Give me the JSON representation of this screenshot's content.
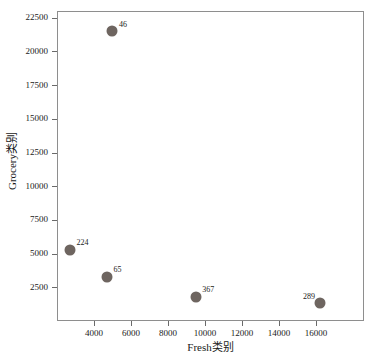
{
  "chart_data": {
    "type": "scatter",
    "title": "",
    "xlabel": "Fresh类别",
    "ylabel": "Grocery类别",
    "xlim": [
      2000,
      18600
    ],
    "ylim": [
      0,
      23000
    ],
    "xticks": [
      4000,
      6000,
      8000,
      10000,
      12000,
      14000,
      16000
    ],
    "xtick_labels": [
      "4000",
      "6000",
      "8000",
      "10000",
      "12000",
      "14000",
      "16000"
    ],
    "yticks": [
      2500,
      5000,
      7500,
      10000,
      12500,
      15000,
      17500,
      20000,
      22500
    ],
    "ytick_labels": [
      "2500",
      "5000",
      "7500",
      "10000",
      "12500",
      "15000",
      "17500",
      "20000",
      "22500"
    ],
    "grid": false,
    "legend": "none",
    "marker_color": "#6e6560",
    "marker_size_px": 11,
    "points": [
      {
        "label": "46",
        "x": 5000,
        "y": 21500,
        "label_side": "right"
      },
      {
        "label": "224",
        "x": 2700,
        "y": 5300,
        "label_side": "right"
      },
      {
        "label": "65",
        "x": 4700,
        "y": 3300,
        "label_side": "right"
      },
      {
        "label": "367",
        "x": 9500,
        "y": 1800,
        "label_side": "right"
      },
      {
        "label": "289",
        "x": 16200,
        "y": 1300,
        "label_side": "left"
      }
    ]
  },
  "colors": {
    "background": "#ffffff",
    "frame": "#8e8e8e",
    "text": "#1a1a1a",
    "marker": "#6e6560"
  }
}
